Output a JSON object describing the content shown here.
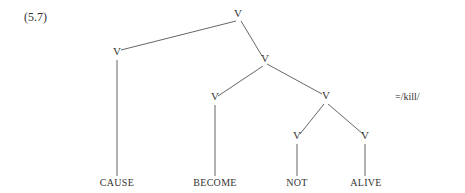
{
  "example_number": "(5.7)",
  "gloss": "=/kill/",
  "tree": {
    "nodes": [
      {
        "id": "root",
        "label": "V",
        "x": 238,
        "y": 15
      },
      {
        "id": "v-cause",
        "label": "V",
        "x": 117,
        "y": 53
      },
      {
        "id": "v-right",
        "label": "V",
        "x": 265,
        "y": 59
      },
      {
        "id": "v-become",
        "label": "V",
        "x": 215,
        "y": 98
      },
      {
        "id": "v-notalive",
        "label": "V",
        "x": 326,
        "y": 97
      },
      {
        "id": "v-not",
        "label": "V",
        "x": 297,
        "y": 137
      },
      {
        "id": "v-alive",
        "label": "V",
        "x": 365,
        "y": 137
      }
    ],
    "leaves": [
      {
        "id": "cause",
        "label": "CAUSE",
        "x": 117,
        "y": 177
      },
      {
        "id": "become",
        "label": "BECOME",
        "x": 215,
        "y": 177
      },
      {
        "id": "not",
        "label": "NOT",
        "x": 297,
        "y": 177
      },
      {
        "id": "alive",
        "label": "ALIVE",
        "x": 366,
        "y": 177
      }
    ],
    "edges": [
      [
        "root",
        "v-cause"
      ],
      [
        "root",
        "v-right"
      ],
      [
        "v-cause",
        "cause"
      ],
      [
        "v-right",
        "v-become"
      ],
      [
        "v-right",
        "v-notalive"
      ],
      [
        "v-become",
        "become"
      ],
      [
        "v-notalive",
        "v-not"
      ],
      [
        "v-notalive",
        "v-alive"
      ],
      [
        "v-not",
        "not"
      ],
      [
        "v-alive",
        "alive"
      ]
    ]
  }
}
